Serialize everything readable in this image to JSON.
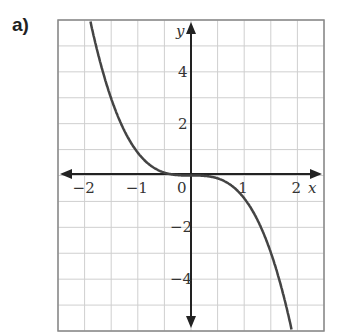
{
  "part_label": "a)",
  "chart_data": {
    "type": "line",
    "title": "",
    "xlabel": "x",
    "ylabel": "y",
    "xlim": [
      -2.5,
      2.5
    ],
    "ylim": [
      -6,
      6
    ],
    "grid": true,
    "grid_step_x": 0.5,
    "grid_step_y": 1,
    "x_tick_labels": [
      "-2",
      "-1",
      "0",
      "1",
      "2"
    ],
    "y_tick_labels": [
      "4",
      "2",
      "-2",
      "-4"
    ],
    "series": [
      {
        "name": "y = -x^3",
        "x": [
          -1.9,
          -1.5,
          -1,
          -0.5,
          0,
          0.5,
          1,
          1.5,
          1.9
        ],
        "y": [
          6.0,
          3.4,
          1,
          0.13,
          0,
          -0.13,
          -1,
          -3.4,
          -6.0
        ]
      }
    ],
    "colors": {
      "curve": "#444444",
      "grid": "#cfcfcf",
      "axis": "#222222"
    }
  }
}
